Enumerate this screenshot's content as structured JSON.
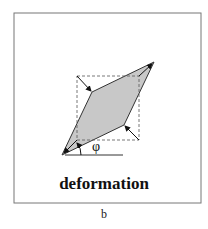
{
  "figure": {
    "title": "deformation",
    "panel_label": "b",
    "angle_label": "φ",
    "colors": {
      "frame": "#777777",
      "fill": "#c8c8c8",
      "stroke": "#222222",
      "dashed": "#555555"
    },
    "shapes": {
      "outer_frame": {
        "x": 14,
        "y": 13,
        "width": 187,
        "height": 190
      },
      "dashed_square": {
        "x": 77,
        "y": 76,
        "width": 62,
        "height": 64
      },
      "parallelogram": [
        [
          62,
          155
        ],
        [
          92,
          92
        ],
        [
          154,
          62
        ],
        [
          124,
          125
        ]
      ],
      "baseline": {
        "x1": 65,
        "y1": 155,
        "x2": 123,
        "y2": 155
      }
    }
  }
}
